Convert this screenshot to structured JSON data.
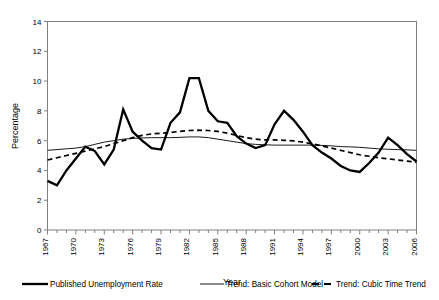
{
  "chart_data": {
    "type": "line",
    "title": "",
    "xlabel": "Year",
    "ylabel": "Percentage",
    "ylim": [
      0,
      14
    ],
    "ytick_step": 2,
    "yticks": [
      0,
      2,
      4,
      6,
      8,
      10,
      12,
      14
    ],
    "xlim": [
      1967,
      2006
    ],
    "xticks_labeled": [
      1967,
      1970,
      1973,
      1976,
      1979,
      1982,
      1985,
      1988,
      1991,
      1994,
      1997,
      2000,
      2003,
      2006
    ],
    "x": [
      1967,
      1968,
      1969,
      1970,
      1971,
      1972,
      1973,
      1974,
      1975,
      1976,
      1977,
      1978,
      1979,
      1980,
      1981,
      1982,
      1983,
      1984,
      1985,
      1986,
      1987,
      1988,
      1989,
      1990,
      1991,
      1992,
      1993,
      1994,
      1995,
      1996,
      1997,
      1998,
      1999,
      2000,
      2001,
      2002,
      2003,
      2004,
      2005,
      2006
    ],
    "grid": false,
    "legend_position": "bottom",
    "series": [
      {
        "name": "Published Unemployment Rate",
        "style": "solid-thick",
        "color": "#000000",
        "values": [
          3.3,
          3.0,
          4.0,
          4.8,
          5.6,
          5.3,
          4.4,
          5.4,
          8.1,
          6.6,
          6.0,
          5.5,
          5.4,
          7.2,
          7.9,
          10.2,
          10.2,
          8.0,
          7.3,
          7.2,
          6.3,
          5.8,
          5.5,
          5.7,
          7.1,
          8.0,
          7.4,
          6.6,
          5.7,
          5.2,
          4.8,
          4.3,
          4.0,
          3.9,
          4.5,
          5.2,
          6.2,
          5.7,
          5.1,
          4.6
        ],
        "legend_order": 1
      },
      {
        "name": "Trend:  Basic Cohort Model",
        "style": "solid-thin",
        "color": "#000000",
        "values": [
          5.35,
          5.4,
          5.45,
          5.5,
          5.6,
          5.75,
          5.9,
          6.0,
          6.1,
          6.15,
          6.18,
          6.2,
          6.2,
          6.2,
          6.22,
          6.25,
          6.25,
          6.2,
          6.1,
          6.0,
          5.9,
          5.8,
          5.75,
          5.72,
          5.7,
          5.7,
          5.7,
          5.7,
          5.7,
          5.68,
          5.65,
          5.6,
          5.58,
          5.55,
          5.5,
          5.45,
          5.42,
          5.4,
          5.38,
          5.35
        ],
        "legend_order": 2
      },
      {
        "name": "Trend:  Cubic Time Trend",
        "style": "dashed",
        "color": "#000000",
        "values": [
          4.7,
          4.85,
          5.0,
          5.15,
          5.3,
          5.45,
          5.6,
          5.8,
          6.0,
          6.2,
          6.35,
          6.45,
          6.5,
          6.55,
          6.62,
          6.68,
          6.7,
          6.68,
          6.62,
          6.5,
          6.35,
          6.2,
          6.1,
          6.05,
          6.05,
          6.02,
          5.98,
          5.9,
          5.78,
          5.65,
          5.5,
          5.35,
          5.2,
          5.05,
          4.95,
          4.85,
          4.78,
          4.7,
          4.62,
          4.55
        ],
        "legend_order": 3
      }
    ]
  },
  "legend": {
    "items": [
      {
        "label": "Published Unemployment Rate",
        "style": "solid-thick"
      },
      {
        "label": "Trend:  Basic Cohort Model",
        "style": "solid-thin"
      },
      {
        "label": "Trend:  Cubic Time Trend",
        "style": "dashed"
      }
    ]
  }
}
